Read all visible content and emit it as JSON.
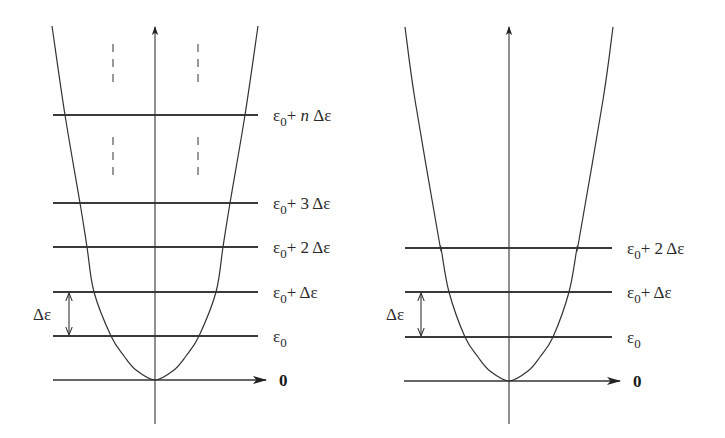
{
  "colors": {
    "ink": "#333333",
    "label": "#2a2a2a",
    "background": "#ffffff"
  },
  "symbols": {
    "epsilon": "ε",
    "delta": "Δ",
    "subscript_zero": "0",
    "plus": "+"
  },
  "diagrams": [
    {
      "id": "left",
      "axis_x": 155,
      "baseline_y": 380,
      "axis_top_y": 27,
      "axis_bottom_y": 424,
      "baseline_x_start": 53,
      "baseline_arrow_tip_x": 266,
      "line_x_start": 53,
      "line_x_end": 258,
      "label_x": 273,
      "zero_label": "0",
      "zero_label_x": 279,
      "curve_half_widths": [
        [
          0,
          0
        ],
        [
          10,
          19
        ],
        [
          24,
          31
        ],
        [
          44,
          44
        ],
        [
          88,
          61
        ],
        [
          133,
          68
        ],
        [
          177,
          75
        ],
        [
          265,
          90
        ],
        [
          354,
          103
        ]
      ],
      "levels": [
        {
          "y": 336,
          "label_main": "ε",
          "label_sub": "0",
          "label_rest": ""
        },
        {
          "y": 292,
          "label_main": "ε",
          "label_sub": "0",
          "label_rest": "+ Δε"
        },
        {
          "y": 247,
          "label_main": "ε",
          "label_sub": "0",
          "label_rest": "+ 2 Δε"
        },
        {
          "y": 203,
          "label_main": "ε",
          "label_sub": "0",
          "label_rest": "+ 3 Δε"
        },
        {
          "y": 115,
          "label_main": "ε",
          "label_sub": "0",
          "label_rest_pre": "+ ",
          "label_italic": "n",
          "label_rest_post": " Δε"
        }
      ],
      "dashes": [
        {
          "x": 113,
          "y1": 44,
          "y2": 89
        },
        {
          "x": 198,
          "y1": 44,
          "y2": 89
        },
        {
          "x": 113,
          "y1": 137,
          "y2": 182
        },
        {
          "x": 198,
          "y1": 137,
          "y2": 182
        }
      ],
      "spacing_marker": {
        "x": 69,
        "y_top": 292,
        "y_bottom": 336,
        "label": "Δε",
        "label_x": 33,
        "label_y": 320
      }
    },
    {
      "id": "right",
      "axis_x": 509,
      "baseline_y": 381,
      "axis_top_y": 27,
      "axis_bottom_y": 424,
      "baseline_x_start": 404,
      "baseline_arrow_tip_x": 620,
      "line_x_start": 405,
      "line_x_end": 612,
      "label_x": 627,
      "zero_label": "0",
      "zero_label_x": 633,
      "curve_half_widths": [
        [
          0,
          0
        ],
        [
          10,
          19
        ],
        [
          24,
          31
        ],
        [
          44,
          44
        ],
        [
          89,
          60
        ],
        [
          133,
          68
        ],
        [
          141,
          70
        ],
        [
          281,
          94
        ],
        [
          354,
          104
        ]
      ],
      "levels": [
        {
          "y": 337,
          "label_main": "ε",
          "label_sub": "0",
          "label_rest": ""
        },
        {
          "y": 292,
          "label_main": "ε",
          "label_sub": "0",
          "label_rest": "+ Δε"
        },
        {
          "y": 248,
          "label_main": "ε",
          "label_sub": "0",
          "label_rest": "+ 2 Δε"
        }
      ],
      "dashes": [],
      "spacing_marker": {
        "x": 421,
        "y_top": 292,
        "y_bottom": 337,
        "label": "Δε",
        "label_x": 386,
        "label_y": 320
      }
    }
  ]
}
